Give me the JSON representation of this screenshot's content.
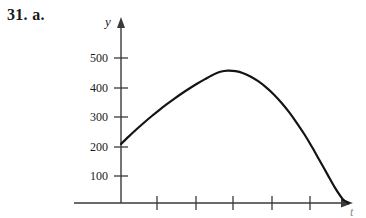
{
  "problem": {
    "label": "31. a."
  },
  "chart_data": {
    "type": "line",
    "title": "",
    "xlabel": "t",
    "ylabel": "y",
    "grid": false,
    "legend": null,
    "xlim": [
      -0.55,
      7.6
    ],
    "ylim": [
      -35,
      560
    ],
    "x_ticks": [
      1,
      2,
      3,
      4,
      5,
      6
    ],
    "x_tick_labels": [
      "",
      "",
      "",
      "",
      "",
      ""
    ],
    "y_ticks": [
      100,
      200,
      300,
      400,
      500
    ],
    "y_tick_labels": [
      "100",
      "200",
      "300",
      "400",
      "500"
    ],
    "annotations": {
      "y_intercept": 200,
      "vertex_x": 2.6,
      "vertex_y": 450,
      "x_intercept": 5.95
    },
    "series": [
      {
        "name": "height",
        "x": [
          0.0,
          0.2,
          0.4,
          0.6,
          0.8,
          1.0,
          1.2,
          1.4,
          1.6,
          1.8,
          2.0,
          2.2,
          2.4,
          2.6,
          2.8,
          3.0,
          3.2,
          3.4,
          3.6,
          3.8,
          4.0,
          4.2,
          4.4,
          4.6,
          4.8,
          5.0,
          5.2,
          5.4,
          5.6,
          5.8,
          5.95
        ],
        "y": [
          200,
          225,
          249,
          272,
          294,
          315,
          335,
          354,
          372,
          389,
          405,
          420,
          434,
          445,
          449,
          447,
          440,
          428,
          412,
          392,
          368,
          340,
          308,
          272,
          233,
          190,
          144,
          98,
          52,
          14,
          0
        ]
      }
    ]
  },
  "axes": {
    "y_arrow": "up-arrow",
    "x_arrow": "right-arrow",
    "y_label_text": "y",
    "x_label_text": "t"
  }
}
